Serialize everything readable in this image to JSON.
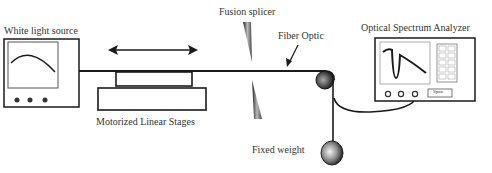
{
  "diagram": {
    "labels": {
      "white_light_source": "White light source",
      "motorized_linear_stages": "Motorized Linear Stages",
      "fusion_splicer": "Fusion splicer",
      "fiber_optic": "Fiber Optic",
      "optical_spectrum_analyzer": "Optical Spectrum Analyzer",
      "fixed_weight": "Fixed weight",
      "osa_span_button": "Span"
    },
    "osa_keypad": [
      "1",
      "2",
      "3",
      "4",
      "5",
      "6",
      "7",
      "8",
      "0",
      "."
    ],
    "colors": {
      "line": "#1a1a1a",
      "text": "#333333",
      "background": "#ffffff"
    }
  }
}
